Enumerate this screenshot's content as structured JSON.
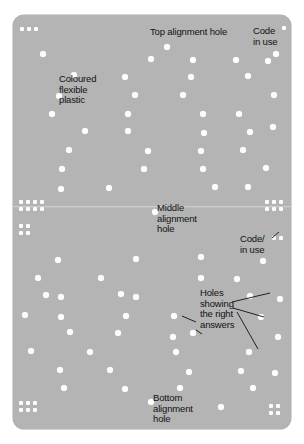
{
  "figure": {
    "card_color": "#b4b4b4",
    "hole_color": "#fdfdfd",
    "text_color": "#111111",
    "background_color": "#ffffff"
  },
  "labels": {
    "top_alignment_hole": "Top alignment hole",
    "code_in_use_top": "Code\nin use",
    "coloured_flexible_plastic": "Coloured\nflexible\nplastic",
    "middle_alignment_hole": "Middle\nalignment\nhole",
    "code_in_use_bottom": "Code/\nin use",
    "holes_showing_right_answers": "Holes\nshowing\nthe right\nanswers",
    "bottom_alignment_hole": "Bottom\nalignment\nhole"
  },
  "holes": [
    {
      "x": 40,
      "y": 51,
      "size": "mid"
    },
    {
      "x": 164,
      "y": 44,
      "size": "mid"
    },
    {
      "x": 190,
      "y": 57,
      "size": "mid"
    },
    {
      "x": 148,
      "y": 56,
      "size": "mid"
    },
    {
      "x": 233,
      "y": 57,
      "size": "mid"
    },
    {
      "x": 273,
      "y": 51,
      "size": "mid"
    },
    {
      "x": 265,
      "y": 58,
      "size": "mid"
    },
    {
      "x": 71,
      "y": 72,
      "size": "mid"
    },
    {
      "x": 122,
      "y": 74,
      "size": "mid"
    },
    {
      "x": 188,
      "y": 74,
      "size": "mid"
    },
    {
      "x": 245,
      "y": 73,
      "size": "mid"
    },
    {
      "x": 56,
      "y": 93,
      "size": "mid"
    },
    {
      "x": 132,
      "y": 92,
      "size": "mid"
    },
    {
      "x": 180,
      "y": 92,
      "size": "mid"
    },
    {
      "x": 271,
      "y": 92,
      "size": "mid"
    },
    {
      "x": 49,
      "y": 111,
      "size": "mid"
    },
    {
      "x": 125,
      "y": 111,
      "size": "mid"
    },
    {
      "x": 200,
      "y": 111,
      "size": "mid"
    },
    {
      "x": 236,
      "y": 111,
      "size": "mid"
    },
    {
      "x": 82,
      "y": 128,
      "size": "mid"
    },
    {
      "x": 125,
      "y": 128,
      "size": "mid"
    },
    {
      "x": 201,
      "y": 130,
      "size": "mid"
    },
    {
      "x": 247,
      "y": 129,
      "size": "mid"
    },
    {
      "x": 270,
      "y": 124,
      "size": "mid"
    },
    {
      "x": 66,
      "y": 147,
      "size": "mid"
    },
    {
      "x": 145,
      "y": 148,
      "size": "mid"
    },
    {
      "x": 198,
      "y": 148,
      "size": "mid"
    },
    {
      "x": 240,
      "y": 147,
      "size": "mid"
    },
    {
      "x": 59,
      "y": 166,
      "size": "mid"
    },
    {
      "x": 141,
      "y": 166,
      "size": "mid"
    },
    {
      "x": 200,
      "y": 166,
      "size": "mid"
    },
    {
      "x": 263,
      "y": 165,
      "size": "mid"
    },
    {
      "x": 58,
      "y": 186,
      "size": "mid"
    },
    {
      "x": 106,
      "y": 185,
      "size": "mid"
    },
    {
      "x": 212,
      "y": 184,
      "size": "mid"
    },
    {
      "x": 245,
      "y": 184,
      "size": "mid"
    },
    {
      "x": 152,
      "y": 209,
      "size": "mid"
    },
    {
      "x": 55,
      "y": 257,
      "size": "mid"
    },
    {
      "x": 133,
      "y": 256,
      "size": "mid"
    },
    {
      "x": 198,
      "y": 254,
      "size": "mid"
    },
    {
      "x": 260,
      "y": 258,
      "size": "mid"
    },
    {
      "x": 35,
      "y": 275,
      "size": "mid"
    },
    {
      "x": 98,
      "y": 275,
      "size": "mid"
    },
    {
      "x": 198,
      "y": 275,
      "size": "mid"
    },
    {
      "x": 234,
      "y": 276,
      "size": "mid"
    },
    {
      "x": 43,
      "y": 292,
      "size": "mid"
    },
    {
      "x": 118,
      "y": 291,
      "size": "mid"
    },
    {
      "x": 133,
      "y": 294,
      "size": "mid"
    },
    {
      "x": 247,
      "y": 293,
      "size": "mid"
    },
    {
      "x": 58,
      "y": 294,
      "size": "mid"
    },
    {
      "x": 22,
      "y": 312,
      "size": "mid"
    },
    {
      "x": 58,
      "y": 314,
      "size": "mid"
    },
    {
      "x": 123,
      "y": 313,
      "size": "mid"
    },
    {
      "x": 171,
      "y": 313,
      "size": "mid"
    },
    {
      "x": 277,
      "y": 296,
      "size": "mid"
    },
    {
      "x": 67,
      "y": 329,
      "size": "mid"
    },
    {
      "x": 115,
      "y": 330,
      "size": "mid"
    },
    {
      "x": 170,
      "y": 334,
      "size": "mid"
    },
    {
      "x": 190,
      "y": 330,
      "size": "mid"
    },
    {
      "x": 258,
      "y": 314,
      "size": "mid"
    },
    {
      "x": 28,
      "y": 348,
      "size": "mid"
    },
    {
      "x": 87,
      "y": 349,
      "size": "mid"
    },
    {
      "x": 173,
      "y": 349,
      "size": "mid"
    },
    {
      "x": 246,
      "y": 349,
      "size": "mid"
    },
    {
      "x": 275,
      "y": 334,
      "size": "mid"
    },
    {
      "x": 57,
      "y": 367,
      "size": "mid"
    },
    {
      "x": 107,
      "y": 367,
      "size": "mid"
    },
    {
      "x": 186,
      "y": 369,
      "size": "mid"
    },
    {
      "x": 238,
      "y": 368,
      "size": "mid"
    },
    {
      "x": 61,
      "y": 385,
      "size": "mid"
    },
    {
      "x": 122,
      "y": 386,
      "size": "mid"
    },
    {
      "x": 177,
      "y": 385,
      "size": "mid"
    },
    {
      "x": 250,
      "y": 385,
      "size": "mid"
    },
    {
      "x": 272,
      "y": 370,
      "size": "mid"
    },
    {
      "x": 148,
      "y": 399,
      "size": "mid"
    },
    {
      "x": 218,
      "y": 404,
      "size": "mid"
    }
  ],
  "marker_groups": [
    {
      "name": "top-left-code-marks",
      "x": 20,
      "y": 27,
      "cols": 3,
      "rows": 1,
      "gap": 7
    },
    {
      "name": "top-right-code-marks",
      "x": 282,
      "y": 26,
      "cols": 1,
      "rows": 1,
      "gap": 7
    },
    {
      "name": "middle-left-code-block",
      "x": 19,
      "y": 200,
      "cols": 4,
      "rows": 2,
      "gap": 7
    },
    {
      "name": "middle-left-code-pair",
      "x": 19,
      "y": 224,
      "cols": 2,
      "rows": 2,
      "gap": 7
    },
    {
      "name": "middle-right-code-block",
      "x": 265,
      "y": 200,
      "cols": 3,
      "rows": 2,
      "gap": 7
    },
    {
      "name": "middle-right-code-pair",
      "x": 272,
      "y": 236,
      "cols": 2,
      "rows": 1,
      "gap": 7
    },
    {
      "name": "bottom-left-code-block",
      "x": 19,
      "y": 401,
      "cols": 3,
      "rows": 2,
      "gap": 7
    },
    {
      "name": "bottom-right-code-block",
      "x": 269,
      "y": 404,
      "cols": 2,
      "rows": 2,
      "gap": 7
    }
  ],
  "leader_lines": [
    {
      "name": "holes-leader-left",
      "x1": 196,
      "y1": 322,
      "x2": 182,
      "y2": 316
    },
    {
      "name": "holes-leader-down-left",
      "x1": 202,
      "y1": 334,
      "x2": 196,
      "y2": 330
    },
    {
      "name": "holes-leader-upper-right",
      "x1": 232,
      "y1": 302,
      "x2": 270,
      "y2": 293
    },
    {
      "name": "holes-leader-mid-right",
      "x1": 233,
      "y1": 308,
      "x2": 264,
      "y2": 317
    },
    {
      "name": "holes-leader-far-down",
      "x1": 237,
      "y1": 312,
      "x2": 258,
      "y2": 349
    },
    {
      "name": "code-in-use-bottom-leader",
      "x1": 272,
      "y1": 238,
      "x2": 279,
      "y2": 232
    }
  ]
}
